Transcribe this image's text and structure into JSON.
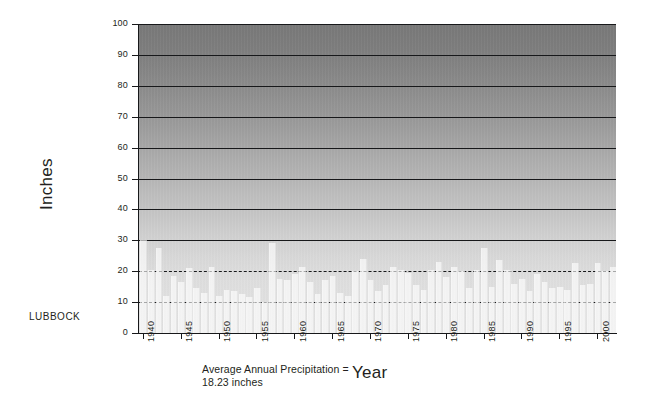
{
  "station": "LUBBOCK",
  "axis": {
    "ylabel": "Inches",
    "xlabel": "Year",
    "yticks": [
      0,
      10,
      20,
      30,
      40,
      50,
      60,
      70,
      80,
      90,
      100
    ],
    "xticks": [
      1940,
      1945,
      1950,
      1955,
      1960,
      1965,
      1970,
      1975,
      1980,
      1985,
      1990,
      1995,
      2000
    ]
  },
  "annotation": {
    "average_line1": "Average Annual Precipitation =",
    "average_line2": "18.23 inches"
  },
  "colors": {
    "ink": "#231f20",
    "bar": "#f2f2f2",
    "plot_top": "#787878",
    "plot_bottom": "#e1e1e1"
  },
  "chart_data": {
    "type": "bar",
    "title": "",
    "xlabel": "Year",
    "ylabel": "Inches",
    "ylim": [
      0,
      100
    ],
    "xlim": [
      1939.5,
      2002.5
    ],
    "grid": true,
    "legend": null,
    "annotations": [
      "Average Annual Precipitation = 18.23 inches",
      "LUBBOCK"
    ],
    "average_annual_precipitation": 18.23,
    "units": "inches",
    "categories": [
      1940,
      1941,
      1942,
      1943,
      1944,
      1945,
      1946,
      1947,
      1948,
      1949,
      1950,
      1951,
      1952,
      1953,
      1954,
      1955,
      1956,
      1957,
      1958,
      1959,
      1960,
      1961,
      1962,
      1963,
      1964,
      1965,
      1966,
      1967,
      1968,
      1969,
      1970,
      1971,
      1972,
      1973,
      1974,
      1975,
      1976,
      1977,
      1978,
      1979,
      1980,
      1981,
      1982,
      1983,
      1984,
      1985,
      1986,
      1987,
      1988,
      1989,
      1990,
      1991,
      1992,
      1993,
      1994,
      1995,
      1996,
      1997,
      1998,
      1999,
      2000,
      2001,
      2002
    ],
    "values": [
      30.0,
      20.5,
      27.5,
      12.0,
      18.5,
      16.5,
      21.0,
      14.5,
      13.0,
      21.5,
      12.0,
      14.0,
      13.5,
      12.5,
      11.5,
      14.5,
      10.0,
      29.0,
      17.5,
      17.0,
      19.0,
      21.5,
      16.5,
      12.5,
      17.0,
      18.5,
      13.0,
      12.0,
      20.0,
      24.0,
      17.0,
      13.5,
      15.5,
      21.5,
      20.5,
      19.5,
      15.5,
      14.0,
      20.5,
      23.0,
      18.0,
      21.5,
      20.0,
      14.5,
      20.5,
      27.5,
      15.0,
      23.5,
      20.5,
      16.0,
      17.5,
      13.5,
      19.0,
      16.5,
      14.5,
      15.0,
      14.0,
      22.5,
      15.5,
      16.0,
      22.5,
      20.0,
      21.5
    ]
  }
}
